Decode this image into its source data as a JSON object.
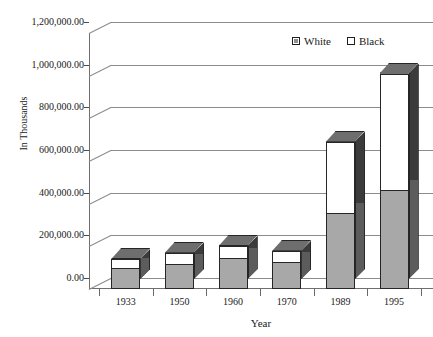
{
  "chart_data": {
    "type": "bar",
    "subtype": "stacked-3d-column",
    "title": "",
    "xlabel": "Year",
    "ylabel": "In Thousands",
    "categories": [
      "1933",
      "1950",
      "1960",
      "1970",
      "1989",
      "1995"
    ],
    "series": [
      {
        "name": "White",
        "values": [
          103000,
          122000,
          150000,
          132000,
          360000,
          470000
        ]
      },
      {
        "name": "Black",
        "values": [
          38000,
          48000,
          52000,
          47000,
          330000,
          540000
        ]
      }
    ],
    "totals": [
      141000,
      170000,
      202000,
      179000,
      690000,
      1010000
    ],
    "ylim": [
      0,
      1200000
    ],
    "ytick_values": [
      0,
      200000,
      400000,
      600000,
      800000,
      1000000,
      1200000
    ],
    "ytick_labels": [
      "0.00",
      "200,000.00",
      "400,000.00",
      "600,000.00",
      "800,000.00",
      "1,000,000.00",
      "1,200,000.00"
    ],
    "grid": true,
    "legend_position": "top-right",
    "legend": [
      "White",
      "Black"
    ],
    "colors": {
      "series_white_fill": "#a8a8a8",
      "series_black_fill": "#ffffff",
      "outline": "#262626",
      "gridline": "#8c8c8c",
      "text": "#1a1a1a"
    }
  },
  "axes": {
    "y_title": "In Thousands",
    "x_title": "Year"
  },
  "legend": {
    "items": [
      {
        "label": "White",
        "swatch": "gray-filled-square-icon"
      },
      {
        "label": "Black",
        "swatch": "white-filled-square-icon"
      }
    ]
  }
}
